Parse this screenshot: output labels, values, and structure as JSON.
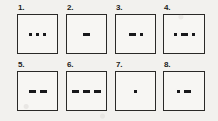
{
  "figure": {
    "background_color": "#f2f1ee",
    "box_fill_color": "#f7f6f3",
    "box_border_color": "#2a2927",
    "mark_color": "#18181a",
    "columns": 4,
    "rows": 2
  },
  "cells": [
    {
      "label": "1.",
      "pattern": "dot dot dot",
      "marks": [
        "dot",
        "dot",
        "dot"
      ]
    },
    {
      "label": "2.",
      "pattern": "dash",
      "marks": [
        "dash"
      ]
    },
    {
      "label": "3.",
      "pattern": "dash dot",
      "marks": [
        "dash",
        "dot"
      ]
    },
    {
      "label": "4.",
      "pattern": "dot dash dot",
      "marks": [
        "dot",
        "dash",
        "dot"
      ]
    },
    {
      "label": "5.",
      "pattern": "dash dash",
      "marks": [
        "dash",
        "dash"
      ]
    },
    {
      "label": "6.",
      "pattern": "dash dash dash",
      "marks": [
        "dash",
        "dash",
        "dash"
      ]
    },
    {
      "label": "7.",
      "pattern": "dot",
      "marks": [
        "dot"
      ]
    },
    {
      "label": "8.",
      "pattern": "dot dash",
      "marks": [
        "dot",
        "dash"
      ]
    }
  ]
}
